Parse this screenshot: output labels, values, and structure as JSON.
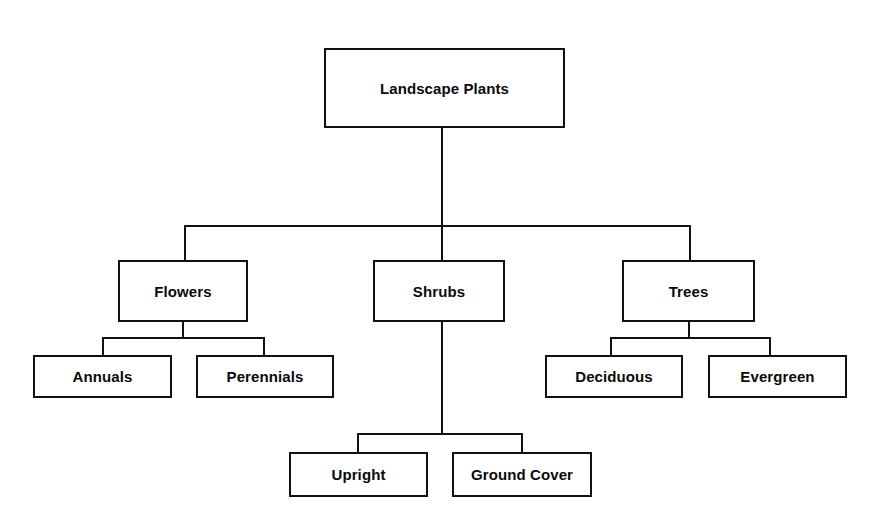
{
  "diagram": {
    "title": "Landscape Plants",
    "type": "hierarchy-tree",
    "background_color": "#ffffff",
    "line_color": "#111111",
    "text_color": "#0a0a0a",
    "nodes": {
      "root": {
        "label": "Landscape Plants"
      },
      "flowers": {
        "label": "Flowers"
      },
      "shrubs": {
        "label": "Shrubs"
      },
      "trees": {
        "label": "Trees"
      },
      "annuals": {
        "label": "Annuals"
      },
      "perennials": {
        "label": "Perennials"
      },
      "upright": {
        "label": "Upright"
      },
      "ground_cover": {
        "label": "Ground Cover"
      },
      "deciduous": {
        "label": "Deciduous"
      },
      "evergreen": {
        "label": "Evergreen"
      }
    }
  }
}
